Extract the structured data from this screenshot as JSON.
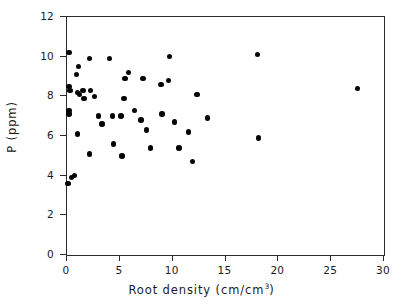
{
  "chart_data": {
    "type": "scatter",
    "title": "",
    "xlabel": "Root density (cm/cm3)",
    "xlabel_base": "Root density (cm/cm",
    "xlabel_sup": "3",
    "xlabel_tail": ")",
    "ylabel": "P (ppm)",
    "xlim": [
      0,
      30
    ],
    "ylim": [
      0,
      12
    ],
    "xticks": [
      0,
      5,
      10,
      15,
      20,
      25,
      30
    ],
    "yticks": [
      0,
      2,
      4,
      6,
      8,
      10,
      12
    ],
    "xtick_labels": [
      "0",
      "5",
      "10",
      "15",
      "20",
      "25",
      "30"
    ],
    "ytick_labels": [
      "0",
      "2",
      "4",
      "6",
      "8",
      "10",
      "12"
    ],
    "grid": false,
    "legend": null,
    "marker": "filled-circle",
    "marker_color": "#050505",
    "marker_size_px": 5.4,
    "frame_color": "#2b2b2b",
    "background_color": "#ffffff",
    "n_points": 47,
    "points": [
      {
        "x": 0.2,
        "y": 10.2
      },
      {
        "x": 1.1,
        "y": 9.5
      },
      {
        "x": 2.1,
        "y": 9.9
      },
      {
        "x": 0.9,
        "y": 9.1
      },
      {
        "x": 0.2,
        "y": 8.5
      },
      {
        "x": 0.3,
        "y": 8.3
      },
      {
        "x": 1.0,
        "y": 8.2
      },
      {
        "x": 1.2,
        "y": 8.1
      },
      {
        "x": 1.5,
        "y": 8.3
      },
      {
        "x": 1.6,
        "y": 7.9
      },
      {
        "x": 2.2,
        "y": 8.3
      },
      {
        "x": 0.2,
        "y": 7.3
      },
      {
        "x": 0.2,
        "y": 7.1
      },
      {
        "x": 1.0,
        "y": 6.1
      },
      {
        "x": 2.1,
        "y": 5.1
      },
      {
        "x": 3.3,
        "y": 6.6
      },
      {
        "x": 4.3,
        "y": 7.0
      },
      {
        "x": 4.0,
        "y": 9.9
      },
      {
        "x": 4.4,
        "y": 5.6
      },
      {
        "x": 5.1,
        "y": 7.0
      },
      {
        "x": 5.2,
        "y": 5.0
      },
      {
        "x": 5.8,
        "y": 9.2
      },
      {
        "x": 5.5,
        "y": 8.9
      },
      {
        "x": 5.4,
        "y": 7.9
      },
      {
        "x": 6.4,
        "y": 7.3
      },
      {
        "x": 7.2,
        "y": 8.9
      },
      {
        "x": 7.0,
        "y": 6.8
      },
      {
        "x": 7.5,
        "y": 6.3
      },
      {
        "x": 7.9,
        "y": 5.4
      },
      {
        "x": 8.9,
        "y": 8.6
      },
      {
        "x": 9.0,
        "y": 7.1
      },
      {
        "x": 9.6,
        "y": 8.8
      },
      {
        "x": 9.7,
        "y": 10.0
      },
      {
        "x": 10.2,
        "y": 6.7
      },
      {
        "x": 10.6,
        "y": 5.4
      },
      {
        "x": 11.5,
        "y": 6.2
      },
      {
        "x": 11.9,
        "y": 4.7
      },
      {
        "x": 12.3,
        "y": 8.1
      },
      {
        "x": 13.3,
        "y": 6.9
      },
      {
        "x": 18.0,
        "y": 10.1
      },
      {
        "x": 18.1,
        "y": 5.9
      },
      {
        "x": 27.5,
        "y": 8.4
      },
      {
        "x": 0.4,
        "y": 3.9
      },
      {
        "x": 0.1,
        "y": 3.6
      },
      {
        "x": 0.7,
        "y": 4.0
      },
      {
        "x": 3.0,
        "y": 7.0
      },
      {
        "x": 2.6,
        "y": 8.0
      }
    ]
  }
}
